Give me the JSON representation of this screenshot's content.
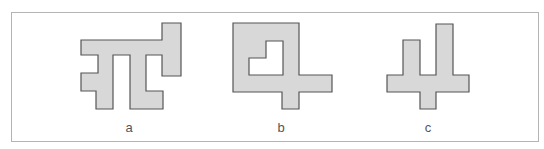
{
  "figure": {
    "colors": {
      "fill": "#d8d8d8",
      "stroke": "#555555",
      "frame": "#b4b4b4"
    },
    "shapes": [
      {
        "id": "a",
        "label": "a",
        "label_x": 129,
        "points": "81,40 162,40 162,23 181,23 181,76 162,76 162,55 146,55 146,91 163,91 163,109 130,109 130,55 113,55 113,109 96,109 96,91 81,91 81,73 98,73 98,55 81,55"
      },
      {
        "id": "b",
        "label": "b",
        "label_x": 281,
        "points": "233,23 299,23 299,75 332,75 332,92 299,92 299,109 282,109 282,92 233,92",
        "hole": "249,58 266,58 266,41 283,41 283,75 249,75"
      },
      {
        "id": "c",
        "label": "c",
        "label_x": 428,
        "points": "436,24 453,24 453,75 469,75 469,92 436,92 436,109 420,109 420,92 387,92 387,75 403,75 403,40 420,40 420,75 436,75"
      }
    ]
  }
}
